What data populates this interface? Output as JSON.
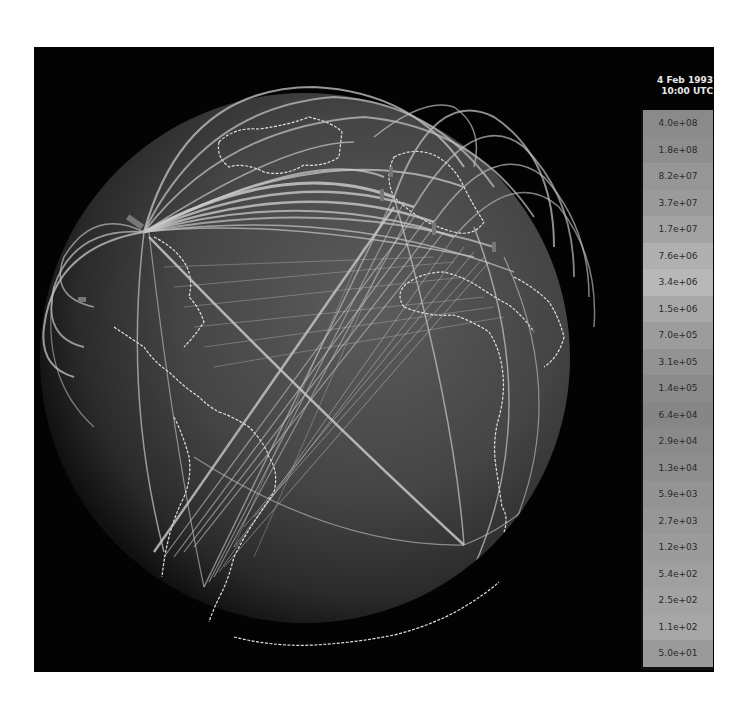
{
  "timestamp": {
    "date": "4 Feb 1993",
    "time": "10:00 UTC"
  },
  "legend": {
    "items": [
      {
        "label": "4.0e+08",
        "color": "#8a8a8a"
      },
      {
        "label": "1.8e+08",
        "color": "#8e8e8e"
      },
      {
        "label": "8.2e+07",
        "color": "#969696"
      },
      {
        "label": "3.7e+07",
        "color": "#9a9a9a"
      },
      {
        "label": "1.7e+07",
        "color": "#a3a3a3"
      },
      {
        "label": "7.6e+06",
        "color": "#b0b0b0"
      },
      {
        "label": "3.4e+06",
        "color": "#b8b8b8"
      },
      {
        "label": "1.5e+06",
        "color": "#a8a8a8"
      },
      {
        "label": "7.0e+05",
        "color": "#9c9c9c"
      },
      {
        "label": "3.1e+05",
        "color": "#939393"
      },
      {
        "label": "1.4e+05",
        "color": "#8b8b8b"
      },
      {
        "label": "6.4e+04",
        "color": "#868686"
      },
      {
        "label": "2.9e+04",
        "color": "#8a8a8a"
      },
      {
        "label": "1.3e+04",
        "color": "#8e8e8e"
      },
      {
        "label": "5.9e+03",
        "color": "#939393"
      },
      {
        "label": "2.7e+03",
        "color": "#979797"
      },
      {
        "label": "1.2e+03",
        "color": "#9b9b9b"
      },
      {
        "label": "5.4e+02",
        "color": "#9f9f9f"
      },
      {
        "label": "2.5e+02",
        "color": "#a3a3a3"
      },
      {
        "label": "1.1e+02",
        "color": "#a6a6a6"
      },
      {
        "label": "5.0e+01",
        "color": "#9a9a9a"
      }
    ]
  },
  "globe": {
    "background": "#030303",
    "sphere_color": "#4a4a4a",
    "arc_color": "#c8c8c8",
    "coast_color": "#e6e6e6"
  }
}
